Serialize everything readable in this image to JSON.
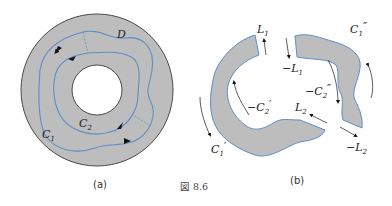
{
  "figure": {
    "caption": "図 8.6",
    "colors": {
      "fill": "#bdbdbd",
      "outline": "#4a4a4a",
      "curve": "#5b8fc9",
      "white": "#ffffff",
      "text": "#222222"
    }
  },
  "panel_a": {
    "label": "(a)",
    "region_label": "D",
    "curve_labels": {
      "c1": "C",
      "c1_sub": "1",
      "c2": "C",
      "c2_sub": "2"
    }
  },
  "panel_b": {
    "label": "(b)",
    "labels": {
      "L1": "L",
      "L1_sub": "1",
      "negL1": "−L",
      "negL1_sub": "1",
      "C1pp": "C",
      "C1pp_sub": "1",
      "C1pp_mark": "″",
      "negC2pp": "−C",
      "negC2pp_sub": "2",
      "negC2pp_mark": "″",
      "negC2p": "−C",
      "negC2p_sub": "2",
      "negC2p_mark": "′",
      "L2": "L",
      "L2_sub": "2",
      "negL2": "−L",
      "negL2_sub": "2",
      "C1p": "C",
      "C1p_sub": "1",
      "C1p_mark": "′"
    }
  }
}
